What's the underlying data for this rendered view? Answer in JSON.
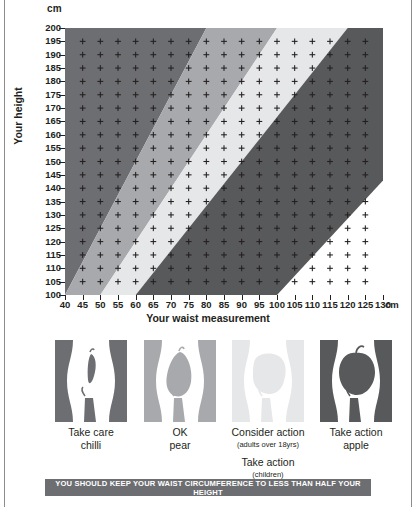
{
  "chart_data": {
    "type": "area",
    "title": "",
    "xlabel": "Your waist measurement",
    "ylabel": "Your height",
    "x_unit": "cm",
    "y_unit": "cm",
    "xlim": [
      40,
      130
    ],
    "ylim": [
      100,
      200
    ],
    "xticks": [
      40,
      45,
      50,
      55,
      60,
      65,
      70,
      75,
      80,
      85,
      90,
      95,
      100,
      105,
      110,
      115,
      120,
      125,
      130
    ],
    "yticks": [
      200,
      195,
      190,
      185,
      180,
      175,
      170,
      165,
      160,
      155,
      150,
      145,
      140,
      135,
      130,
      125,
      120,
      115,
      110,
      105,
      100
    ],
    "grid": "plus-marker-grid",
    "legend_position": "below-as-figures",
    "bands": [
      {
        "name": "take-care-chilli",
        "ratio_range": [
          0.0,
          0.4
        ],
        "color": "#6d6e71",
        "label": "Take care"
      },
      {
        "name": "ok-pear",
        "ratio_range": [
          0.4,
          0.5
        ],
        "color": "#a7a9ac",
        "label": "OK"
      },
      {
        "name": "consider-action-pearapple",
        "ratio_range": [
          0.5,
          0.6
        ],
        "color": "#e6e7e8",
        "label": "Consider action"
      },
      {
        "name": "take-action-apple",
        "ratio_range": [
          0.6,
          1.0
        ],
        "color": "#58595b",
        "label": "Take action"
      }
    ],
    "boundary_lines": [
      {
        "ratio": 0.4,
        "waist_at_height_100": 40,
        "waist_at_height_200": 80
      },
      {
        "ratio": 0.5,
        "waist_at_height_100": 50,
        "waist_at_height_200": 100
      },
      {
        "ratio": 0.6,
        "waist_at_height_100": 60,
        "waist_at_height_200": 120
      }
    ],
    "annotation": "YOU SHOULD KEEP YOUR WAIST CIRCUMFERENCE TO LESS THAN HALF YOUR HEIGHT"
  },
  "axes": {
    "y_unit_label": "cm",
    "y_title": "Your height",
    "x_title": "Your waist measurement",
    "x_unit_label": "cm"
  },
  "figures": [
    {
      "id": "chilli",
      "panel_color": "#6d6e71",
      "shape_color": "#6d6e71",
      "line1": "Take care",
      "line2": "chilli",
      "sub1": "",
      "line3": "",
      "sub2": "",
      "line4": ""
    },
    {
      "id": "pear",
      "panel_color": "#a7a9ac",
      "shape_color": "#a7a9ac",
      "line1": "OK",
      "line2": "pear",
      "sub1": "",
      "line3": "",
      "sub2": "",
      "line4": ""
    },
    {
      "id": "pearapple",
      "panel_color": "#e6e7e8",
      "shape_color": "#e6e7e8",
      "line1": "Consider action",
      "sub1": "(adults over 18yrs)",
      "line3": "Take action",
      "sub2": "(children)",
      "line4": "pearapple",
      "line2": ""
    },
    {
      "id": "apple",
      "panel_color": "#58595b",
      "shape_color": "#58595b",
      "line1": "Take action",
      "line2": "apple",
      "sub1": "",
      "line3": "",
      "sub2": "",
      "line4": ""
    }
  ],
  "banner": {
    "text": "YOU SHOULD KEEP YOUR WAIST CIRCUMFERENCE TO LESS THAN HALF YOUR HEIGHT",
    "background": "#6d6e71",
    "color": "#ffffff"
  }
}
